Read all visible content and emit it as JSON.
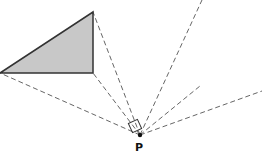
{
  "diagram": {
    "point_label": "P",
    "colors": {
      "triangle_fill": "#c8c8c8",
      "triangle_stroke": "#333333",
      "dashed_line": "#666666",
      "point": "#111111"
    },
    "triangle": [
      [
        0,
        73
      ],
      [
        93,
        12
      ],
      [
        93,
        73
      ]
    ],
    "point": [
      140,
      135
    ],
    "rays_to": [
      [
        0,
        73
      ],
      [
        93,
        12
      ],
      [
        93,
        73
      ],
      [
        202,
        0
      ],
      [
        200,
        86
      ],
      [
        262,
        91
      ]
    ]
  }
}
